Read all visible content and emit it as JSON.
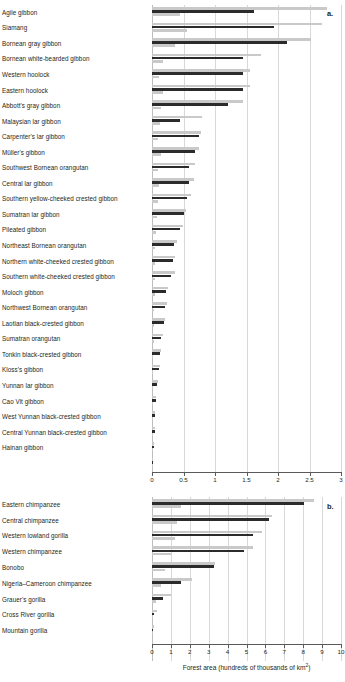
{
  "figure": {
    "panels": [
      {
        "letter": "a.",
        "axis": {
          "title": "",
          "ticks": [
            0,
            0.5,
            1,
            1.5,
            2,
            2.5,
            3
          ],
          "tick_labels": [
            "0",
            "0.5",
            "1",
            "1.5",
            "2",
            "2.5",
            "3"
          ],
          "min": 0,
          "max": 3
        }
      },
      {
        "letter": "b.",
        "axis": {
          "title_prefix": "Forest area (hundreds of thousands of km",
          "title_sup": "2",
          "title_suffix": ")",
          "ticks": [
            0,
            1,
            2,
            3,
            4,
            5,
            6,
            7,
            8,
            9,
            10
          ],
          "tick_labels": [
            "0",
            "1",
            "2",
            "3",
            "4",
            "5",
            "6",
            "7",
            "8",
            "9",
            "10"
          ],
          "min": 0,
          "max": 10
        }
      }
    ]
  },
  "chart_data": [
    {
      "type": "bar",
      "orientation": "horizontal",
      "panel": "a",
      "title": "",
      "xlabel": "Forest area (hundreds of thousands of km2)",
      "ylabel": "",
      "xlim": [
        0,
        3
      ],
      "grid": true,
      "legend": "none",
      "series": [
        {
          "name": "upper-light",
          "color": "#c9c9c9",
          "values": [
            2.78,
            2.7,
            2.52,
            1.73,
            1.56,
            1.56,
            1.44,
            0.8,
            0.78,
            0.74,
            0.69,
            0.66,
            0.62,
            0.54,
            0.49,
            0.39,
            0.37,
            0.36,
            0.25,
            0.24,
            0.21,
            0.17,
            0.14,
            0.12,
            0.1,
            0.07,
            0.055,
            0.045,
            0.03,
            0.02
          ]
        },
        {
          "name": "middle-dark",
          "color": "#2b2b2b",
          "values": [
            1.62,
            1.94,
            2.14,
            1.44,
            1.45,
            1.44,
            1.21,
            0.45,
            0.74,
            0.69,
            0.59,
            0.58,
            0.56,
            0.5,
            0.45,
            0.35,
            0.34,
            0.3,
            0.23,
            0.21,
            0.19,
            0.15,
            0.12,
            0.105,
            0.085,
            0.06,
            0.05,
            0.04,
            0.025,
            0.015
          ]
        },
        {
          "name": "lower-light",
          "color": "#c9c9c9",
          "values": [
            0.44,
            0.55,
            0.36,
            0.17,
            0.11,
            0.18,
            0.14,
            0.13,
            0.1,
            0.14,
            0.09,
            0.11,
            0.09,
            0.08,
            0.07,
            0.05,
            0.05,
            0.05,
            0.04,
            0.035,
            0.03,
            0.03,
            0.02,
            0.02,
            0.015,
            0.012,
            0.01,
            0.008,
            0.006,
            0.004
          ]
        }
      ],
      "categories": [
        "Agile gibbon",
        "Siamang",
        "Bornean gray gibbon",
        "Bornean white-bearded gibbon",
        "Western hoolock",
        "Eastern hoolock",
        "Abbott's gray gibbon",
        "Malaysian lar gibbon",
        "Carpenter's lar gibbon",
        "Müller's gibbon",
        "Southwest Bornean orangutan",
        "Central lar gibbon",
        "Southern yellow-cheeked crested gibbon",
        "Sumatran lar gibbon",
        "Pileated gibbon",
        "Northeast Bornean orangutan",
        "Northern white-cheeked crested gibbon",
        "Southern white-cheeked crested gibbon",
        "Moloch gibbon",
        "Northwest Bornean orangutan",
        "Laotian black-crested gibbon",
        "Sumatran orangutan",
        "Tonkin black-crested gibbon",
        "Kloss's gibbon",
        "Yunnan lar gibbon",
        "Cao Vit gibbon",
        "West Yunnan black-crested gibbon",
        "Central Yunnan black-crested gibbon",
        "Hainan gibbon",
        ""
      ]
    },
    {
      "type": "bar",
      "orientation": "horizontal",
      "panel": "b",
      "title": "",
      "xlabel": "Forest area (hundreds of thousands of km2)",
      "ylabel": "",
      "xlim": [
        0,
        10
      ],
      "grid": true,
      "legend": "none",
      "series": [
        {
          "name": "upper-light",
          "color": "#c9c9c9",
          "values": [
            8.55,
            6.35,
            5.8,
            5.35,
            3.35,
            2.1,
            1.0,
            0.24,
            0.1
          ]
        },
        {
          "name": "middle-dark",
          "color": "#2b2b2b",
          "values": [
            8.05,
            6.2,
            5.35,
            4.85,
            3.3,
            1.55,
            0.6,
            0.12,
            0.05
          ]
        },
        {
          "name": "lower-light",
          "color": "#c9c9c9",
          "values": [
            1.55,
            1.3,
            1.2,
            1.0,
            0.7,
            0.45,
            0.22,
            0.06,
            0.02
          ]
        }
      ],
      "categories": [
        "Eastern chimpanzee",
        "Central chimpanzee",
        "Western lowland gorilla",
        "Western chimpanzee",
        "Bonobo",
        "Nigeria–Cameroon chimpanzee",
        "Grauer's gorilla",
        "Cross River gorilla",
        "Mountain gorilla"
      ]
    }
  ]
}
